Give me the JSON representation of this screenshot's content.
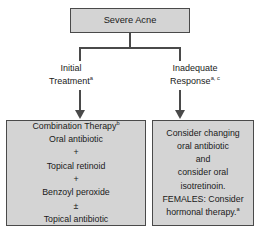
{
  "diagram": {
    "type": "flowchart",
    "colors": {
      "node_fill": "#d4d4d4",
      "node_border": "#4a4a4a",
      "connector": "#4a4a4a",
      "text": "#1a1a1a",
      "background": "#ffffff"
    },
    "root": {
      "label": "Severe Acne"
    },
    "branches": [
      {
        "id": "initial-treatment",
        "label_line1": "Initial",
        "label_line2": "Treatment",
        "label_superscript": "a",
        "arrow": "down-arrow-icon"
      },
      {
        "id": "inadequate-response",
        "label_line1": "Inadequate",
        "label_line2": "Response",
        "label_superscript": "a, c",
        "arrow": "down-arrow-icon"
      }
    ],
    "outcomes": [
      {
        "id": "combination-therapy",
        "heading": "Combination Therapy",
        "heading_superscript": "b",
        "lines": [
          "Oral antibiotic",
          "+",
          "Topical retinoid",
          "+",
          "Benzoyl peroxide",
          "±",
          "Topical antibiotic"
        ]
      },
      {
        "id": "consider-changing",
        "lines": [
          "Consider changing",
          "oral antibiotic",
          "and",
          "consider oral",
          "isotretinoin.",
          "FEMALES: Consider",
          "hormonal therapy."
        ],
        "last_line_superscript": "a"
      }
    ]
  }
}
